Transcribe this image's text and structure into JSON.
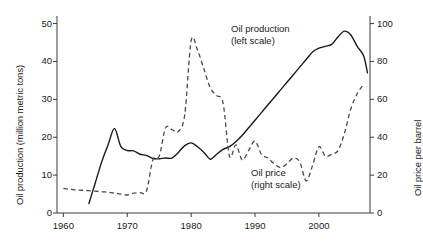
{
  "chart_data": {
    "type": "line",
    "title": "",
    "xlabel": "",
    "xlim": [
      1959,
      2008
    ],
    "xticks": [
      1960,
      1970,
      1980,
      1990,
      2000
    ],
    "xtick_labels": [
      "1960",
      "1970",
      "1980",
      "1990",
      "2000"
    ],
    "grid": false,
    "legend_position": "inline-annotations",
    "axes": {
      "left": {
        "label": "Oil production (million metric tons)",
        "ylim": [
          0,
          52
        ],
        "ticks": [
          0,
          10,
          20,
          30,
          40,
          50
        ],
        "tick_labels": [
          "0",
          "10",
          "20",
          "30",
          "40",
          "50"
        ]
      },
      "right": {
        "label": "Oil price per barrel",
        "ylim": [
          0,
          104
        ],
        "ticks": [
          0,
          20,
          40,
          60,
          80,
          100
        ],
        "tick_labels": [
          "0",
          "20",
          "40",
          "60",
          "80",
          "100"
        ]
      }
    },
    "annotations": [
      {
        "name": "oil-production-annotation",
        "line1": "Oil production",
        "line2": "(left scale)"
      },
      {
        "name": "oil-price-annotation",
        "line1": "Oil price",
        "line2": "(right scale)"
      }
    ],
    "series": [
      {
        "name": "Oil production",
        "axis": "left",
        "unit": "million metric tons",
        "style": "solid",
        "color": "#1a1a1a",
        "x": [
          1964,
          1965,
          1966,
          1967,
          1968,
          1969,
          1970,
          1971,
          1972,
          1973,
          1974,
          1975,
          1976,
          1977,
          1978,
          1979,
          1980,
          1981,
          1982,
          1983,
          1984,
          1985,
          1986,
          1987,
          1988,
          1989,
          1990,
          1991,
          1992,
          1993,
          1994,
          1995,
          1996,
          1997,
          1998,
          1999,
          2000,
          2001,
          2002,
          2003,
          2004,
          2005,
          2006,
          2007
        ],
        "values": [
          2.5,
          8.0,
          13.5,
          18.0,
          22.3,
          17.5,
          16.5,
          16.4,
          15.5,
          15.2,
          14.4,
          14.3,
          14.5,
          14.5,
          16.0,
          17.8,
          18.5,
          17.5,
          16.0,
          14.2,
          15.5,
          16.8,
          17.5,
          18.8,
          20.5,
          22.5,
          24.5,
          26.5,
          28.5,
          30.5,
          32.5,
          34.5,
          36.5,
          38.5,
          40.5,
          42.5,
          43.5,
          44.0,
          44.5,
          46.5,
          48.0,
          47.0,
          44.0,
          41.5
        ],
        "end_value": 37.0
      },
      {
        "name": "Oil price",
        "axis": "right",
        "unit": "price per barrel",
        "style": "dashed",
        "color": "#4a4a4a",
        "x": [
          1960,
          1961,
          1962,
          1963,
          1964,
          1965,
          1966,
          1967,
          1968,
          1969,
          1970,
          1971,
          1972,
          1973,
          1974,
          1975,
          1976,
          1977,
          1978,
          1979,
          1980,
          1981,
          1982,
          1983,
          1984,
          1985,
          1986,
          1987,
          1988,
          1989,
          1990,
          1991,
          1992,
          1993,
          1994,
          1995,
          1996,
          1997,
          1998,
          1999,
          2000,
          2001,
          2002,
          2003,
          2004,
          2005,
          2006,
          2007
        ],
        "values": [
          13.0,
          12.5,
          12.2,
          12.0,
          11.8,
          11.5,
          11.2,
          11.0,
          10.5,
          10.0,
          9.5,
          10.5,
          10.8,
          11.5,
          28.0,
          30.0,
          45.0,
          44.0,
          43.0,
          52.0,
          91.0,
          86.0,
          76.0,
          66.0,
          62.0,
          58.0,
          30.0,
          36.0,
          28.0,
          33.0,
          38.0,
          31.0,
          29.0,
          26.0,
          24.0,
          26.0,
          29.0,
          27.0,
          17.0,
          25.0,
          35.0,
          30.0,
          31.0,
          33.0,
          42.0,
          55.0,
          63.0,
          68.0
        ]
      }
    ]
  }
}
